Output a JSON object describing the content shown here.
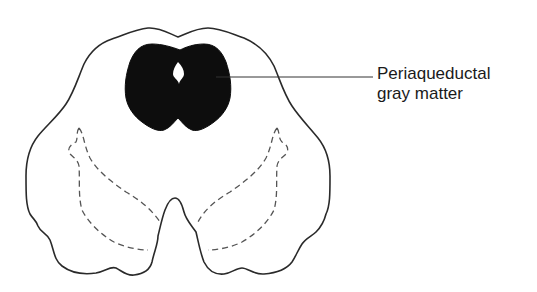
{
  "diagram": {
    "type": "anatomical cross-section",
    "structures": [
      {
        "id": "outer-outline",
        "style": "solid outline"
      },
      {
        "id": "periaqueductal-gray",
        "style": "solid black fill"
      },
      {
        "id": "cerebral-aqueduct",
        "style": "white opening in gray matter"
      },
      {
        "id": "left-dashed-region",
        "style": "dashed outline"
      },
      {
        "id": "right-dashed-region",
        "style": "dashed outline"
      }
    ],
    "label": {
      "line1": "Periaqueductal",
      "line2": "gray matter",
      "points_to": "periaqueductal-gray"
    },
    "colors": {
      "outline": "#2a2a2a",
      "fill": "#0d0d0d",
      "dashed": "#555555",
      "background": "#ffffff"
    }
  }
}
